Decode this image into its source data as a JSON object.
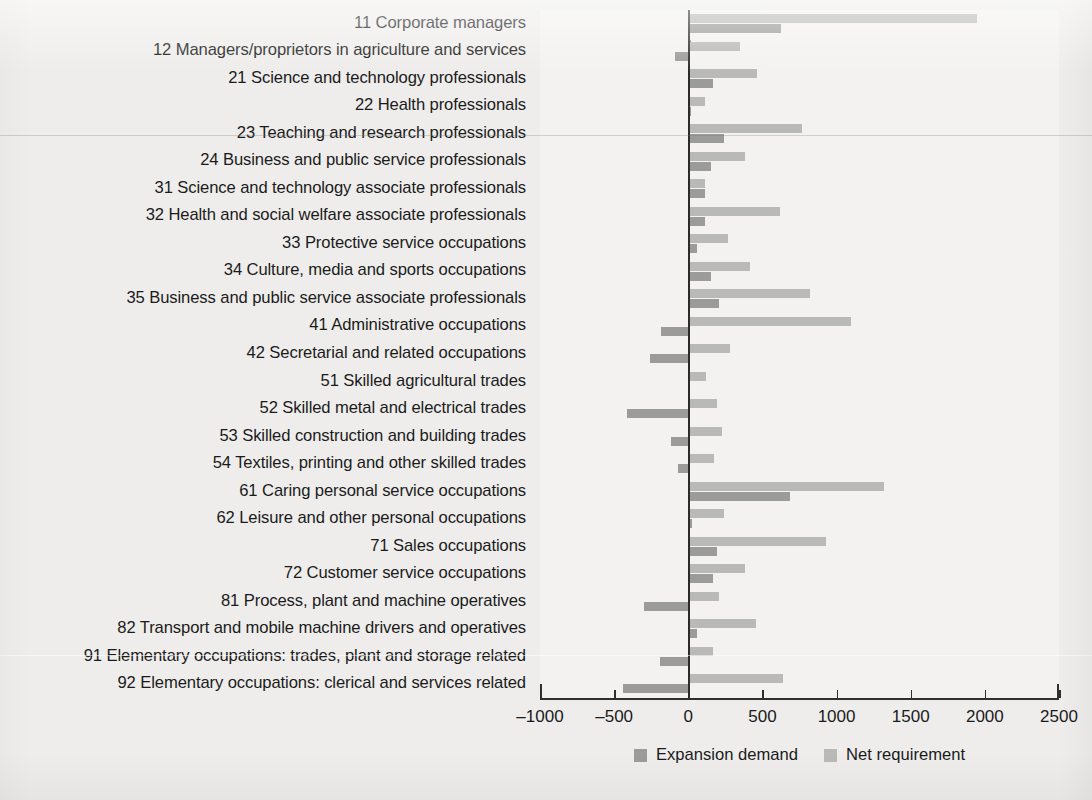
{
  "chart_data": {
    "type": "bar",
    "orientation": "horizontal",
    "title": "",
    "xlabel": "",
    "ylabel": "",
    "xlim": [
      -1000,
      2500
    ],
    "xticks": [
      -1000,
      -500,
      0,
      500,
      1000,
      1500,
      2000,
      2500
    ],
    "xtick_labels": [
      "–1000",
      "–500",
      "0",
      "500",
      "1000",
      "1500",
      "2000",
      "2500"
    ],
    "grid": false,
    "legend_position": "bottom-center",
    "categories": [
      "11  Corporate managers",
      "12 Managers/proprietors in agriculture and services",
      "21 Science and technology professionals",
      "22 Health professionals",
      "23 Teaching and research professionals",
      "24 Business and public service professionals",
      "31 Science and technology associate professionals",
      "32 Health and social welfare associate professionals",
      "33 Protective service occupations",
      "34 Culture, media and sports occupations",
      "35 Business and public service associate professionals",
      "41 Administrative occupations",
      "42 Secretarial and related occupations",
      "51 Skilled agricultural trades",
      "52 Skilled metal and electrical trades",
      "53 Skilled construction and building trades",
      "54 Textiles, printing and other skilled trades",
      "61 Caring personal service occupations",
      "62 Leisure and other personal occupations",
      "71 Sales occupations",
      "72 Customer service occupations",
      "81 Process, plant and machine operatives",
      "82 Transport and mobile machine drivers and operatives",
      "91 Elementary occupations: trades, plant and storage related",
      "92 Elementary occupations: clerical and services related"
    ],
    "series": [
      {
        "name": "Net requirement",
        "color": "#b9b9b7",
        "values": [
          1950,
          350,
          465,
          110,
          770,
          380,
          110,
          620,
          270,
          415,
          820,
          1100,
          280,
          120,
          195,
          230,
          175,
          1320,
          240,
          930,
          385,
          210,
          460,
          165,
          640
        ]
      },
      {
        "name": "Expansion demand",
        "color": "#9b9b99",
        "values": [
          625,
          -90,
          165,
          20,
          240,
          150,
          115,
          110,
          60,
          155,
          205,
          -185,
          -255,
          0,
          -415,
          -115,
          -70,
          685,
          25,
          195,
          170,
          -300,
          60,
          -190,
          -440
        ]
      }
    ]
  },
  "legend": {
    "items": [
      {
        "label": "Expansion demand",
        "color": "#9b9b99",
        "swatch_name": "expansion-demand-swatch"
      },
      {
        "label": "Net requirement",
        "color": "#b9b9b7",
        "swatch_name": "net-requirement-swatch"
      }
    ]
  },
  "colors": {
    "page_background": "#eeedeb",
    "plot_background": "#f3f2f0",
    "axis": "#2b2b2b",
    "text": "#1b1b1b",
    "expansion_demand": "#9b9b99",
    "net_requirement": "#b9b9b7"
  }
}
